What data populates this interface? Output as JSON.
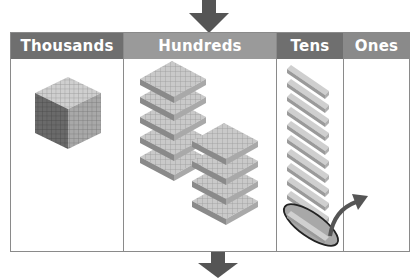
{
  "diagram": {
    "columns": [
      {
        "label": "Thousands",
        "header_color": "#6f6f6f",
        "width": 113,
        "blocks": {
          "type": "cube",
          "count": 1
        }
      },
      {
        "label": "Hundreds",
        "header_color": "#9a9a9a",
        "width": 153,
        "blocks": {
          "type": "flat",
          "count": 9,
          "stacks": [
            5,
            4
          ]
        }
      },
      {
        "label": "Tens",
        "header_color": "#6f6f6f",
        "width": 67,
        "blocks": {
          "type": "rod",
          "count": 11,
          "circled": 1
        }
      },
      {
        "label": "Ones",
        "header_color": "#8a8a8a",
        "width": 67,
        "blocks": {
          "type": "unit",
          "count": 0
        }
      }
    ],
    "annotations": {
      "top_arrow": "down-arrow",
      "bottom_arrow": "down-arrow",
      "regroup_arrow": "curved-arrow-tens-to-ones",
      "circled_rod": "ellipse-highlight"
    },
    "colors": {
      "arrow": "#555555",
      "border": "#8a8a8a",
      "block_light": "#d4d4d4",
      "block_mid": "#b5b5b5",
      "block_dark": "#7d7d7d",
      "ellipse_fill": "#a8a8a8",
      "ellipse_stroke": "#222222"
    }
  }
}
